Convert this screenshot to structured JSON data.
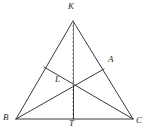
{
  "figure": {
    "kind": "euclidean-geometry-diagram",
    "canvas": {
      "width": 147,
      "height": 131,
      "background": "#ffffff"
    },
    "stroke": {
      "solid_color": "#3a3a3a",
      "dashed_color": "#9a9a9a",
      "solid_width": 1,
      "dashed_width": 1,
      "dash_pattern": "2 2"
    },
    "label_color": "#2b2b2b",
    "points": [
      {
        "id": "K",
        "label": "K",
        "x": 73,
        "y": 21,
        "label_x": 68,
        "label_y": 2
      },
      {
        "id": "B",
        "label": "B",
        "x": 16,
        "y": 119,
        "label_x": 3,
        "label_y": 113
      },
      {
        "id": "C",
        "label": "C",
        "x": 133,
        "y": 119,
        "label_x": 136,
        "label_y": 116
      },
      {
        "id": "A",
        "label": "A",
        "x": 104,
        "y": 69,
        "label_x": 108,
        "label_y": 55
      },
      {
        "id": "L",
        "label": "L",
        "x": 44,
        "y": 67,
        "label_x": 55,
        "label_y": 75
      },
      {
        "id": "T",
        "label": "T",
        "x": 73,
        "y": 119,
        "label_x": 69,
        "label_y": 119
      },
      {
        "id": "P",
        "label": "",
        "x": 73,
        "y": 85,
        "label_x": 0,
        "label_y": 0
      }
    ],
    "segments": [
      {
        "id": "KB",
        "from": "K",
        "to": "B",
        "style": "solid"
      },
      {
        "id": "KC",
        "from": "K",
        "to": "C",
        "style": "solid"
      },
      {
        "id": "BC",
        "from": "B",
        "to": "C",
        "style": "solid"
      },
      {
        "id": "KT",
        "from": "K",
        "to": "T",
        "style": "dashed"
      },
      {
        "id": "PT",
        "from": "P",
        "to": "T",
        "style": "solid"
      },
      {
        "id": "LC",
        "from": "L",
        "to": "C",
        "style": "solid"
      },
      {
        "id": "BA",
        "from": "B",
        "to": "A",
        "style": "solid"
      },
      {
        "id": "AB_ext",
        "from": "A",
        "to": "B",
        "style": "solid"
      }
    ]
  }
}
